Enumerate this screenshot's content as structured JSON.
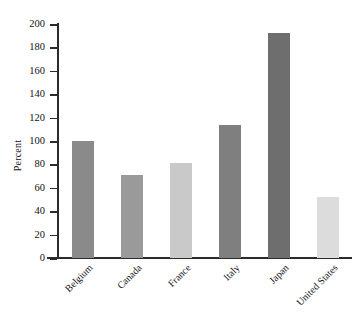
{
  "chart_data": {
    "type": "bar",
    "title": "",
    "subtitle": "",
    "xlabel": "",
    "ylabel": "Percent",
    "ylim": [
      0,
      200
    ],
    "ytick_labels": [
      "200",
      "180",
      "160",
      "140",
      "120",
      "100",
      "80",
      "60",
      "40",
      "20",
      "0"
    ],
    "ytick_values": [
      200,
      180,
      160,
      140,
      120,
      100,
      80,
      60,
      40,
      20,
      0
    ],
    "grid": false,
    "legend": "none",
    "categories": [
      "Belgium",
      "Canada",
      "France",
      "Italy",
      "Japan",
      "United States"
    ],
    "values": [
      100,
      71,
      81,
      114,
      192,
      52
    ],
    "bar_colors": [
      "#8a8a8a",
      "#9a9a9a",
      "#c9c9c9",
      "#7f7f7f",
      "#6e6e6e",
      "#dcdcdc"
    ],
    "axis_color": "#2b2b2b",
    "background": "#ffffff"
  }
}
